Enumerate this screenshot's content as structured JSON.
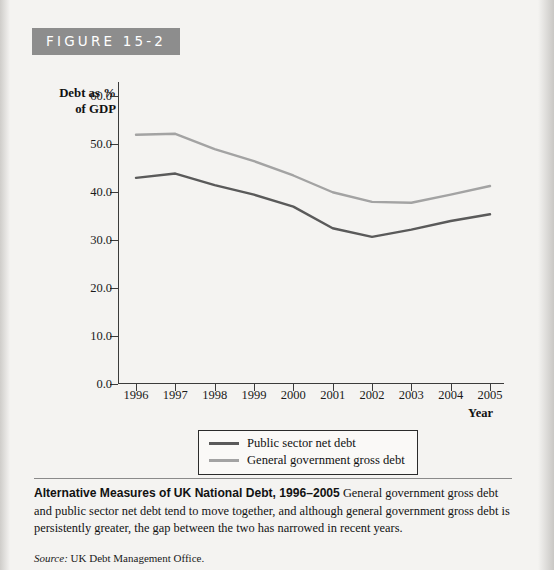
{
  "figure": {
    "tag": "FIGURE 15-2"
  },
  "chart_data": {
    "type": "line",
    "title": "Alternative Measures of UK National Debt, 1996–2005",
    "xlabel": "Year",
    "ylabel": "Debt as % of GDP",
    "ylabel_line1": "Debt as %",
    "ylabel_line2": "of GDP",
    "categories": [
      "1996",
      "1997",
      "1998",
      "1999",
      "2000",
      "2001",
      "2002",
      "2003",
      "2004",
      "2005"
    ],
    "x": [
      1996,
      1997,
      1998,
      1999,
      2000,
      2001,
      2002,
      2003,
      2004,
      2005
    ],
    "ylim": [
      0.0,
      63.0
    ],
    "yticks": [
      0.0,
      10.0,
      20.0,
      30.0,
      40.0,
      50.0,
      60.0
    ],
    "ytick_labels": [
      "0.0",
      "10.0",
      "20.0",
      "30.0",
      "40.0",
      "50.0",
      "60.0"
    ],
    "grid": false,
    "legend_position": "below-axes",
    "series": [
      {
        "name": "Public sector net debt",
        "color": "#5a5a5a",
        "values": [
          43.0,
          43.9,
          41.5,
          39.5,
          37.0,
          32.5,
          30.7,
          32.2,
          34.0,
          35.4
        ]
      },
      {
        "name": "General government gross debt",
        "color": "#a3a3a3",
        "values": [
          52.0,
          52.2,
          49.0,
          46.5,
          43.5,
          40.0,
          38.0,
          37.8,
          39.5,
          41.3
        ]
      }
    ]
  },
  "caption": {
    "bold_lead": "Alternative Measures of UK National Debt, 1996–2005",
    "body": " General government gross debt and public sector net debt tend to move together, and although general government gross debt is persistently greater, the gap between the two has narrowed in recent years.",
    "source_label": "Source:",
    "source_text": " UK Debt Management Office."
  }
}
